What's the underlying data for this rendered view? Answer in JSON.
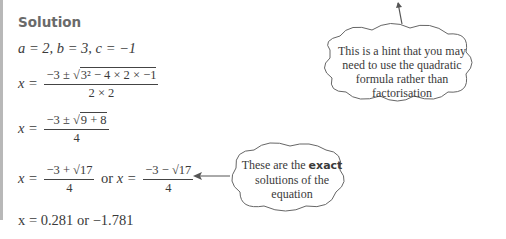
{
  "heading": "Solution",
  "lines": {
    "coefficients": "a = 2, b = 3, c = −1",
    "step1": {
      "lhs": "x =",
      "num_prefix": "−3 ± √",
      "num_radicand": "3² − 4 × 2 × −1",
      "den": "2 × 2"
    },
    "step2": {
      "lhs": "x =",
      "num_prefix": "−3 ± √",
      "num_radicand": "9 + 8",
      "den": "4"
    },
    "step3": {
      "lhs": "x =",
      "num1": "−3 + √17",
      "den1": "4",
      "or": "or",
      "lhs2": "x =",
      "num2": "−3 − √17",
      "den2": "4"
    },
    "result": "x = 0.281 or −1.781"
  },
  "callouts": {
    "hint": "This is a hint that you may need to use the quadratic formula rather than factorisation",
    "hint_lines": [
      "This is a hint that you may",
      "need to use the quadratic",
      "formula rather than",
      "factorisation"
    ],
    "exact_pre": "These are the ",
    "exact_bold": "exact",
    "exact_line2": "solutions of the",
    "exact_line3": "equation"
  },
  "colors": {
    "text": "#3a3a3a",
    "heading": "#6a6a6a",
    "bar": "#b8b8b8"
  }
}
